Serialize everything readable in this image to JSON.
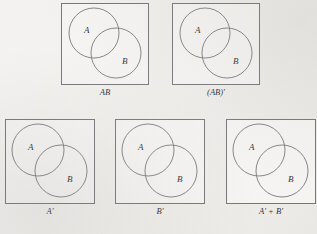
{
  "figure": {
    "background_color": "#f2f1ee",
    "line_color": "#6e6e72",
    "text_color": "#1d1d1f",
    "rows": 2,
    "panel_count": 5
  },
  "panels": [
    {
      "id": "panel-ab",
      "caption": "AB",
      "set_a_label": "A",
      "set_b_label": "B",
      "box": {
        "x": 61,
        "y": 3,
        "w": 88,
        "h": 82
      },
      "circle_a": {
        "cx": 33,
        "cy": 30,
        "r": 25
      },
      "circle_b": {
        "cx": 55,
        "cy": 50,
        "r": 25
      },
      "label_a_pos": {
        "x": 23,
        "y": 23
      },
      "label_b_pos": {
        "x": 61,
        "y": 54
      },
      "caption_pos": {
        "y": 88
      }
    },
    {
      "id": "panel-ab-complement",
      "caption": "(AB)'",
      "set_a_label": "A",
      "set_b_label": "B",
      "box": {
        "x": 172,
        "y": 3,
        "w": 88,
        "h": 82
      },
      "circle_a": {
        "cx": 33,
        "cy": 30,
        "r": 25
      },
      "circle_b": {
        "cx": 55,
        "cy": 50,
        "r": 25
      },
      "label_a_pos": {
        "x": 23,
        "y": 23
      },
      "label_b_pos": {
        "x": 61,
        "y": 54
      },
      "caption_pos": {
        "y": 88
      }
    },
    {
      "id": "panel-a-complement",
      "caption": "A'",
      "set_a_label": "A",
      "set_b_label": "B",
      "box": {
        "x": 5,
        "y": 119,
        "w": 90,
        "h": 85
      },
      "circle_a": {
        "cx": 33,
        "cy": 31,
        "r": 26
      },
      "circle_b": {
        "cx": 56,
        "cy": 52,
        "r": 26
      },
      "label_a_pos": {
        "x": 23,
        "y": 24
      },
      "label_b_pos": {
        "x": 62,
        "y": 56
      },
      "caption_pos": {
        "y": 207
      }
    },
    {
      "id": "panel-b-complement",
      "caption": "B'",
      "set_a_label": "A",
      "set_b_label": "B",
      "box": {
        "x": 115,
        "y": 119,
        "w": 90,
        "h": 85
      },
      "circle_a": {
        "cx": 33,
        "cy": 31,
        "r": 26
      },
      "circle_b": {
        "cx": 56,
        "cy": 52,
        "r": 26
      },
      "label_a_pos": {
        "x": 23,
        "y": 24
      },
      "label_b_pos": {
        "x": 62,
        "y": 56
      },
      "caption_pos": {
        "y": 207
      }
    },
    {
      "id": "panel-a-plus-b-complement",
      "caption": "A' + B'",
      "set_a_label": "A",
      "set_b_label": "B",
      "box": {
        "x": 226,
        "y": 119,
        "w": 90,
        "h": 85
      },
      "circle_a": {
        "cx": 33,
        "cy": 31,
        "r": 26
      },
      "circle_b": {
        "cx": 56,
        "cy": 52,
        "r": 26
      },
      "label_a_pos": {
        "x": 23,
        "y": 24
      },
      "label_b_pos": {
        "x": 62,
        "y": 56
      },
      "caption_pos": {
        "y": 207
      }
    }
  ]
}
